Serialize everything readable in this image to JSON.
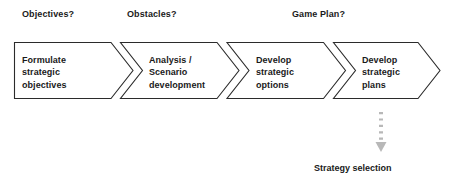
{
  "diagram": {
    "title_labels": [
      {
        "id": "objectives",
        "label": "Objectives?"
      },
      {
        "id": "obstacles",
        "label": "Obstacles?"
      },
      {
        "id": "gameplan",
        "label": "Game Plan?"
      }
    ],
    "stages": [
      {
        "index": 1,
        "text": "Formulate\nstrategic\nobjectives"
      },
      {
        "index": 2,
        "text": "Analysis /\nScenario\ndevelopment"
      },
      {
        "index": 3,
        "text": "Develop\nstrategic\noptions"
      },
      {
        "index": 4,
        "text": "Develop\nstrategic\nplans"
      }
    ],
    "output": {
      "label": "Strategy selection",
      "connector": "dotted-down-arrow"
    },
    "colors": {
      "background": "#ffffff",
      "stroke": "#2b2b2b",
      "text": "#1a1a1a",
      "connector": "#b0b0b0"
    }
  }
}
